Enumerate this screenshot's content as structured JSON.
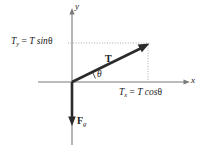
{
  "figure": {
    "background_color": "#ffffff",
    "axis_color": "#6b6b6b",
    "vector_color": "#2b2b2b",
    "dotted_color": "#a9a9a9",
    "text_color": "#1a1a1a"
  },
  "axes": {
    "y_label": "y",
    "x_label": "x",
    "origin": {
      "x": 72,
      "y": 82
    }
  },
  "labels": {
    "y_component": {
      "symbol": "T",
      "sub": "y",
      "equals": "=",
      "expression": "T sin",
      "angle": "θ"
    },
    "x_component": {
      "symbol": "T",
      "sub": "x",
      "equals": "=",
      "expression": "T cos",
      "angle": "θ"
    },
    "tension_vector": "T",
    "gravity_vector": {
      "symbol": "F",
      "sub": "g"
    },
    "angle": "θ"
  },
  "vectors": [
    {
      "name": "tension",
      "label": "T",
      "from": {
        "x": 72,
        "y": 82
      },
      "to": {
        "x": 148,
        "y": 44
      },
      "style": "bold-arrow"
    },
    {
      "name": "weight",
      "label": "Fg",
      "from": {
        "x": 72,
        "y": 82
      },
      "to": {
        "x": 72,
        "y": 125
      },
      "style": "bold-arrow"
    }
  ],
  "guides": [
    {
      "name": "horizontal-projection",
      "from": {
        "x": 68,
        "y": 43
      },
      "to": {
        "x": 148,
        "y": 43
      },
      "style": "dotted"
    },
    {
      "name": "vertical-projection",
      "from": {
        "x": 148,
        "y": 44
      },
      "to": {
        "x": 148,
        "y": 82
      },
      "style": "dotted"
    }
  ]
}
